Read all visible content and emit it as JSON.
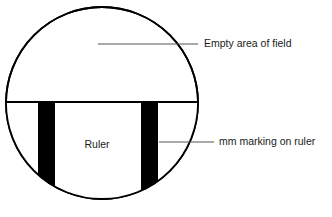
{
  "figure": {
    "background_color": "#ffffff",
    "stroke_color": "#000000",
    "leader_line_color": "#555555",
    "text_color": "#1a1a1a"
  },
  "field_circle": {
    "name": "empty area of field",
    "center_x": 102,
    "center_y": 103,
    "radius": 97,
    "fill": "#ffffff",
    "stroke": "#000000",
    "stroke_width": 2
  },
  "ruler": {
    "label": "Ruler",
    "label_x": 97,
    "label_y": 145,
    "edge_line_y": 102,
    "fill": "#ffffff"
  },
  "mm_markings": [
    {
      "name": "mm-marking-left",
      "x": 38,
      "width": 17,
      "color": "#000000"
    },
    {
      "name": "mm-marking-right",
      "x": 141,
      "width": 17,
      "color": "#000000"
    }
  ],
  "annotations": [
    {
      "id": "empty-area",
      "label": "Empty area of field",
      "text_x": 204,
      "text_y": 44,
      "leader_x1": 98,
      "leader_y1": 44,
      "leader_x2": 198,
      "leader_y2": 44
    },
    {
      "id": "mm-marking",
      "label": "mm marking on ruler",
      "text_x": 219,
      "text_y": 142,
      "leader_x1": 159,
      "leader_y1": 142,
      "leader_x2": 214,
      "leader_y2": 142
    }
  ]
}
